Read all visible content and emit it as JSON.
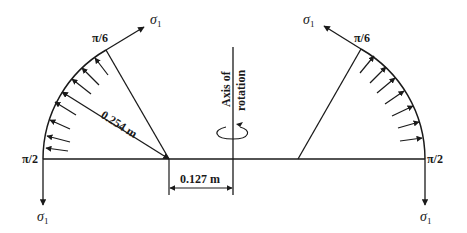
{
  "diagram": {
    "labels": {
      "sigma_top_left": "σ",
      "sigma_top_right": "σ",
      "sigma_bottom_left": "σ",
      "sigma_bottom_right": "σ",
      "sigma_subscript": "1",
      "pi6_left": "π/6",
      "pi6_right": "π/6",
      "pi2_left": "π/2",
      "pi2_right": "π/2",
      "radius": "0.254 m",
      "offset": "0.127 m",
      "axis_line1": "Axis of",
      "axis_line2": "rotation"
    },
    "colors": {
      "stroke": "#1a1a1a",
      "background": "#ffffff"
    }
  }
}
